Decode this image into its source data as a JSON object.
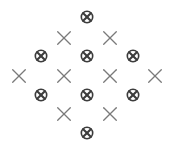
{
  "canvas": {
    "width": 174,
    "height": 151,
    "background": "#ffffff"
  },
  "legend": {
    "circled_x_name": "circled-x-marker",
    "plain_x_name": "plain-x-marker"
  },
  "style": {
    "circled_x_color": "#3c3c3c",
    "plain_x_color": "#7a7a7a",
    "circled_x_size": 13,
    "plain_x_size": 15,
    "circled_x_stroke": 1.6,
    "plain_x_stroke": 1.3
  },
  "chart_data": {
    "type": "scatter",
    "title": "",
    "subtitle": "",
    "xlabel": "",
    "ylabel": "",
    "xlim": [
      0,
      174
    ],
    "ylim": [
      0,
      151
    ],
    "grid": false,
    "legend_position": "none",
    "axes_visible": false,
    "tick_labels_x": [],
    "tick_labels_y": [],
    "annotations": [],
    "series": [
      {
        "name": "circled-x",
        "marker": "circled_x",
        "color": "#3c3c3c",
        "count": 8,
        "points": [
          {
            "x": 87,
            "y": 17,
            "row": 1,
            "col": 1
          },
          {
            "x": 41,
            "y": 56,
            "row": 3,
            "col": 1
          },
          {
            "x": 87,
            "y": 56,
            "row": 3,
            "col": 2
          },
          {
            "x": 133,
            "y": 56,
            "row": 3,
            "col": 3
          },
          {
            "x": 41,
            "y": 95,
            "row": 5,
            "col": 1
          },
          {
            "x": 87,
            "y": 95,
            "row": 5,
            "col": 2
          },
          {
            "x": 133,
            "y": 95,
            "row": 5,
            "col": 3
          },
          {
            "x": 87,
            "y": 133,
            "row": 7,
            "col": 1
          }
        ]
      },
      {
        "name": "plain-x",
        "marker": "plain_x",
        "color": "#7a7a7a",
        "count": 8,
        "points": [
          {
            "x": 64,
            "y": 38,
            "row": 2,
            "col": 1
          },
          {
            "x": 110,
            "y": 38,
            "row": 2,
            "col": 2
          },
          {
            "x": 19,
            "y": 76,
            "row": 4,
            "col": 1
          },
          {
            "x": 64,
            "y": 76,
            "row": 4,
            "col": 2
          },
          {
            "x": 110,
            "y": 76,
            "row": 4,
            "col": 3
          },
          {
            "x": 155,
            "y": 76,
            "row": 4,
            "col": 4
          },
          {
            "x": 64,
            "y": 114,
            "row": 6,
            "col": 1
          },
          {
            "x": 110,
            "y": 114,
            "row": 6,
            "col": 2
          }
        ]
      }
    ]
  }
}
